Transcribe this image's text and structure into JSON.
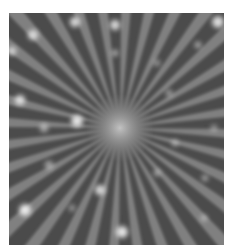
{
  "image": {
    "subject": "starburst light rays with bokeh sparkles",
    "colors": {
      "page_background": "#ffffff",
      "background": "#4b4b4b",
      "ray": "#8a8a8a",
      "glow": "#bdbdbd",
      "sparkle": "#ffffff"
    },
    "frame": {
      "x": 9,
      "y": 13,
      "width": 215,
      "height": 232
    },
    "center": {
      "x": 111,
      "y": 115
    },
    "ray_count": 32,
    "sparkles": [
      {
        "x": 66,
        "y": 9,
        "r": 5,
        "o": 0.85
      },
      {
        "x": 106,
        "y": 12,
        "r": 5,
        "o": 0.85
      },
      {
        "x": 24,
        "y": 22,
        "r": 5,
        "o": 0.8
      },
      {
        "x": 3,
        "y": 38,
        "r": 4,
        "o": 0.7
      },
      {
        "x": 209,
        "y": 9,
        "r": 6,
        "o": 0.9
      },
      {
        "x": 106,
        "y": 40,
        "r": 3,
        "o": 0.5
      },
      {
        "x": 189,
        "y": 32,
        "r": 3,
        "o": 0.5
      },
      {
        "x": 11,
        "y": 87,
        "r": 5,
        "o": 0.85
      },
      {
        "x": 68,
        "y": 108,
        "r": 6,
        "o": 0.95
      },
      {
        "x": 35,
        "y": 115,
        "r": 4,
        "o": 0.55
      },
      {
        "x": 91,
        "y": 177,
        "r": 5,
        "o": 0.85
      },
      {
        "x": 16,
        "y": 197,
        "r": 6,
        "o": 0.95
      },
      {
        "x": 113,
        "y": 219,
        "r": 6,
        "o": 0.95
      },
      {
        "x": 40,
        "y": 152,
        "r": 4,
        "o": 0.5
      },
      {
        "x": 160,
        "y": 80,
        "r": 3,
        "o": 0.45
      },
      {
        "x": 166,
        "y": 130,
        "r": 3,
        "o": 0.45
      },
      {
        "x": 196,
        "y": 165,
        "r": 3,
        "o": 0.45
      },
      {
        "x": 148,
        "y": 160,
        "r": 3,
        "o": 0.45
      },
      {
        "x": 63,
        "y": 195,
        "r": 3,
        "o": 0.4
      },
      {
        "x": 195,
        "y": 205,
        "r": 3,
        "o": 0.4
      },
      {
        "x": 205,
        "y": 115,
        "r": 3,
        "o": 0.4
      },
      {
        "x": 148,
        "y": 50,
        "r": 3,
        "o": 0.4
      }
    ]
  }
}
